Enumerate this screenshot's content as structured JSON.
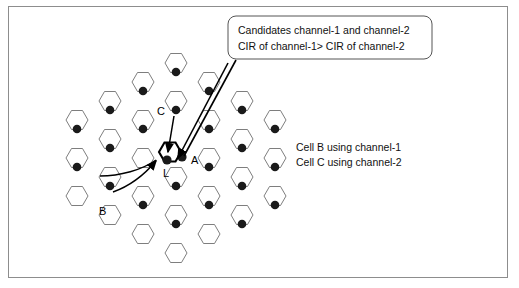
{
  "figure": {
    "frame": {
      "border_color": "#8d8d8d",
      "background": "#ffffff"
    },
    "callout": {
      "line1": "Candidates channel-1 and channel-2",
      "line2": "CIR of channel-1> CIR of channel-2",
      "border_color": "#555555",
      "background": "#ffffff"
    },
    "annotations": {
      "line1": "Cell B using channel-1",
      "line2": "Cell C using channel-2"
    },
    "cell_labels": {
      "a": "A",
      "b": "B",
      "c": "C",
      "l": "L"
    },
    "colors": {
      "hex_stroke": "#6f6f6f",
      "hex_stroke_bold": "#000000",
      "dot_fill": "#1a1a1a",
      "leader_line": "#000000"
    },
    "grid": {
      "hex_width": 44,
      "hex_height": 38,
      "cell_count": 22,
      "cells": [
        {
          "cx": 176,
          "cy": 72
        },
        {
          "cx": 143,
          "cy": 91
        },
        {
          "cx": 209,
          "cy": 91
        },
        {
          "cx": 110,
          "cy": 110
        },
        {
          "cx": 176,
          "cy": 110
        },
        {
          "cx": 242,
          "cy": 110
        },
        {
          "cx": 143,
          "cy": 129
        },
        {
          "cx": 209,
          "cy": 129
        },
        {
          "cx": 77,
          "cy": 129
        },
        {
          "cx": 110,
          "cy": 148
        },
        {
          "cx": 176,
          "cy": 152
        },
        {
          "cx": 242,
          "cy": 148
        },
        {
          "cx": 77,
          "cy": 167
        },
        {
          "cx": 143,
          "cy": 167
        },
        {
          "cx": 209,
          "cy": 167
        },
        {
          "cx": 110,
          "cy": 186
        },
        {
          "cx": 176,
          "cy": 186
        },
        {
          "cx": 242,
          "cy": 186
        },
        {
          "cx": 143,
          "cy": 205
        },
        {
          "cx": 209,
          "cy": 205
        },
        {
          "cx": 176,
          "cy": 224
        },
        {
          "cx": 242,
          "cy": 224
        }
      ]
    }
  }
}
